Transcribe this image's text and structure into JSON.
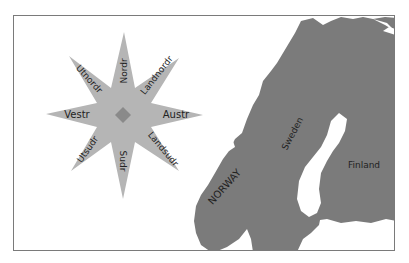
{
  "compass": {
    "center": "diamond",
    "directions": {
      "north": "Nordr",
      "northeast": "Landnordr",
      "east": "Austr",
      "southeast": "Landsudr",
      "south": "Sudr",
      "southwest": "Utsudr",
      "west": "Vestr",
      "northwest": "Utnordr"
    }
  },
  "map": {
    "labels": {
      "norway": "NORWAY",
      "sweden": "Sweden",
      "finland": "Finland"
    }
  },
  "colors": {
    "star": "#b5b5b5",
    "diamond": "#8a8a8a",
    "land": "#7b7b7b",
    "water": "#ffffff",
    "border": "#7a7a7a"
  }
}
